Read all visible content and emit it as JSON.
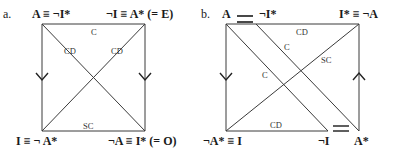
{
  "diagram_a": {
    "tag": "a.",
    "corners": {
      "top_left": "A ≡ ¬I*",
      "top_right": "¬I ≡ A* (= E)",
      "bottom_left": "I ≡ ¬ A*",
      "bottom_right": "¬A ≡ I* (= O)"
    },
    "edges": {
      "top": "C",
      "diag_left": "CD",
      "diag_right": "CD",
      "bottom": "SC"
    }
  },
  "diagram_b": {
    "tag": "b.",
    "corners": {
      "top_left": "A",
      "top_mid": "¬I*",
      "top_right": "I* ≡ ¬A",
      "bottom_left": "¬A* ≡ I",
      "bottom_mid": "¬I",
      "bottom_right": "A*"
    },
    "edges": {
      "top": "CD",
      "diag_inner": "C",
      "diag_outer": "C",
      "diag_sc": "SC",
      "bottom": "CD"
    }
  }
}
